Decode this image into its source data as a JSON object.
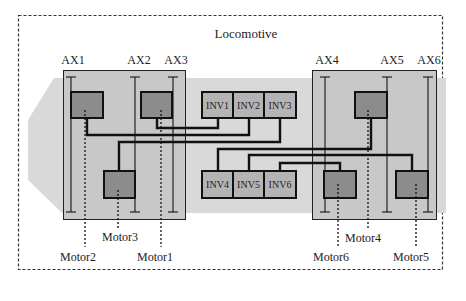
{
  "title": "Locomotive",
  "axles": [
    {
      "label": "AX1",
      "x": 71
    },
    {
      "label": "AX2",
      "x": 135
    },
    {
      "label": "AX3",
      "x": 173
    },
    {
      "label": "AX4",
      "x": 325
    },
    {
      "label": "AX5",
      "x": 387
    },
    {
      "label": "AX6",
      "x": 428
    }
  ],
  "inverters_top": [
    {
      "label": "INV1"
    },
    {
      "label": "INV2"
    },
    {
      "label": "INV3"
    }
  ],
  "inverters_bottom": [
    {
      "label": "INV4"
    },
    {
      "label": "INV5"
    },
    {
      "label": "INV6"
    }
  ],
  "motors": [
    {
      "label": "Motor1"
    },
    {
      "label": "Motor2"
    },
    {
      "label": "Motor3"
    },
    {
      "label": "Motor4"
    },
    {
      "label": "Motor5"
    },
    {
      "label": "Motor6"
    }
  ],
  "colors": {
    "band": "#d9d9d9",
    "bogie": "#c8c8c8",
    "motor": "#8c8c8c",
    "inverter": "#b4b4b4",
    "line": "#1a1a1a"
  }
}
